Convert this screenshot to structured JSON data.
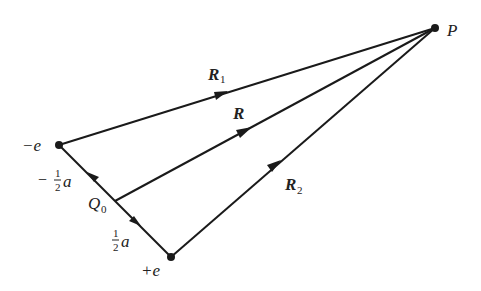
{
  "diagram": {
    "colors": {
      "line": "#1a1a1a",
      "text": "#222222",
      "background": "#ffffff"
    },
    "points": {
      "P": {
        "x": 435,
        "y": 28,
        "label": "P"
      },
      "neg_charge": {
        "x": 59,
        "y": 145,
        "label": "−e"
      },
      "pos_charge": {
        "x": 171,
        "y": 257,
        "label": "+e"
      },
      "Q0": {
        "x": 115,
        "y": 201,
        "label": "Q",
        "subscript": "0"
      }
    },
    "vectors": [
      {
        "name": "R1",
        "label": "R",
        "subscript": "1",
        "from": "neg_charge",
        "to": "P"
      },
      {
        "name": "R",
        "label": "R",
        "subscript": "",
        "from": "Q0",
        "to": "P"
      },
      {
        "name": "R2",
        "label": "R",
        "subscript": "2",
        "from": "pos_charge",
        "to": "P"
      }
    ],
    "displacements": [
      {
        "name": "minus-half-a",
        "sign": "−",
        "numerator": "1",
        "denominator": "2",
        "var": "a",
        "from": "Q0",
        "to": "neg_charge"
      },
      {
        "name": "plus-half-a",
        "sign": "",
        "numerator": "1",
        "denominator": "2",
        "var": "a",
        "from": "Q0",
        "to": "pos_charge"
      }
    ]
  }
}
